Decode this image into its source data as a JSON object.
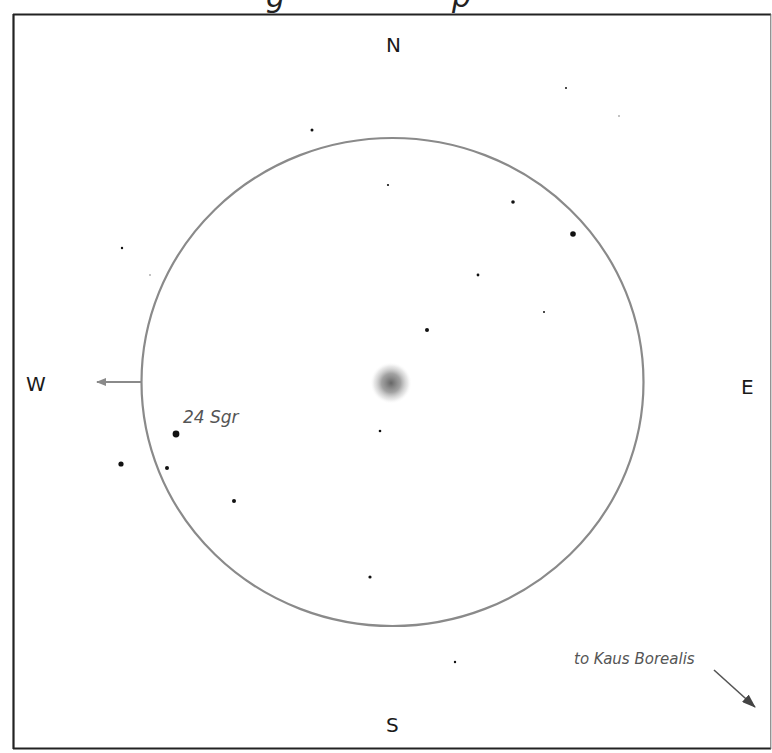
{
  "finder_chart": {
    "directions": {
      "north": "N",
      "south": "S",
      "east": "E",
      "west": "W"
    },
    "labels": {
      "star_24sgr": "24 Sgr",
      "pointer_kaus_borealis": "to Kaus Borealis"
    },
    "colors": {
      "frame": "#222222",
      "field_circle": "#8a8a8a",
      "arrow": "#7a7a7a",
      "star": "#111111",
      "nebula": "#6e6e6e",
      "label_text": "#555555"
    },
    "field_of_view": {
      "center": [
        392,
        382
      ],
      "radius_x": 251,
      "radius_y": 244
    },
    "stars": [
      {
        "x": 312,
        "y": 130,
        "r": 1.5
      },
      {
        "x": 388,
        "y": 185,
        "r": 1.1
      },
      {
        "x": 566,
        "y": 88,
        "r": 1.0
      },
      {
        "x": 619,
        "y": 116,
        "r": 0.8
      },
      {
        "x": 513,
        "y": 202,
        "r": 1.8
      },
      {
        "x": 573,
        "y": 234,
        "r": 2.8
      },
      {
        "x": 478,
        "y": 275,
        "r": 1.4
      },
      {
        "x": 544,
        "y": 312,
        "r": 1.0
      },
      {
        "x": 427,
        "y": 330,
        "r": 2.0
      },
      {
        "x": 122,
        "y": 248,
        "r": 1.2
      },
      {
        "x": 150,
        "y": 275,
        "r": 0.8
      },
      {
        "x": 380,
        "y": 431,
        "r": 1.3
      },
      {
        "x": 176,
        "y": 434,
        "r": 3.4,
        "name": "24 Sgr"
      },
      {
        "x": 121,
        "y": 464,
        "r": 2.6
      },
      {
        "x": 167,
        "y": 468,
        "r": 2.0
      },
      {
        "x": 234,
        "y": 501,
        "r": 2.0
      },
      {
        "x": 370,
        "y": 577,
        "r": 1.6
      },
      {
        "x": 455,
        "y": 662,
        "r": 1.2
      }
    ],
    "nebula": {
      "x": 391,
      "y": 383,
      "radius": 20
    }
  }
}
